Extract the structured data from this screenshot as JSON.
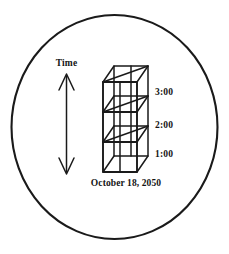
{
  "figure": {
    "axis": {
      "label": "Time",
      "arrow_direction": "double-vertical"
    },
    "date_caption": "October 18, 2050",
    "tick_labels": [
      {
        "text": "3:00",
        "level": "top"
      },
      {
        "text": "2:00",
        "level": "middle"
      },
      {
        "text": "1:00",
        "level": "bottom"
      }
    ],
    "object": {
      "name": "three-tier-wireframe-prism",
      "tiers": 3,
      "projection": "oblique"
    },
    "colors": {
      "ink": "#1a1a1a",
      "background": "#ffffff",
      "text": "#141414"
    }
  }
}
